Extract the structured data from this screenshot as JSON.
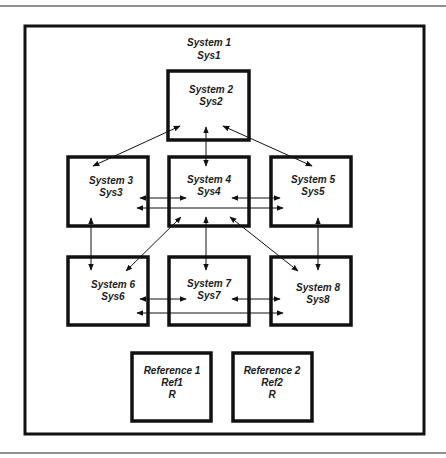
{
  "diagram": {
    "colors": {
      "stroke": "#111111",
      "background": "#ffffff",
      "text": "#1a1a1a"
    },
    "container": {
      "title": "System 1",
      "subtitle": "Sys1"
    },
    "nodes": [
      {
        "id": "sys2",
        "title": "System 2",
        "subtitle": "Sys2"
      },
      {
        "id": "sys3",
        "title": "System 3",
        "subtitle": "Sys3"
      },
      {
        "id": "sys4",
        "title": "System 4",
        "subtitle": "Sys4"
      },
      {
        "id": "sys5",
        "title": "System 5",
        "subtitle": "Sys5"
      },
      {
        "id": "sys6",
        "title": "System 6",
        "subtitle": "Sys6"
      },
      {
        "id": "sys7",
        "title": "System 7",
        "subtitle": "Sys7"
      },
      {
        "id": "sys8",
        "title": "System 8",
        "subtitle": "Sys8"
      }
    ],
    "references": [
      {
        "id": "ref1",
        "title": "Reference 1",
        "subtitle": "Ref1",
        "code": "R"
      },
      {
        "id": "ref2",
        "title": "Reference 2",
        "subtitle": "Ref2",
        "code": "R"
      }
    ],
    "edges": [
      {
        "from": "sys2",
        "to": "sys3",
        "direction": "bidirectional"
      },
      {
        "from": "sys2",
        "to": "sys4",
        "direction": "bidirectional"
      },
      {
        "from": "sys2",
        "to": "sys5",
        "direction": "bidirectional"
      },
      {
        "from": "sys3",
        "to": "sys4",
        "direction": "bidirectional"
      },
      {
        "from": "sys3",
        "to": "sys5",
        "direction": "bidirectional"
      },
      {
        "from": "sys4",
        "to": "sys5",
        "direction": "bidirectional"
      },
      {
        "from": "sys3",
        "to": "sys6",
        "direction": "bidirectional"
      },
      {
        "from": "sys4",
        "to": "sys6",
        "direction": "bidirectional"
      },
      {
        "from": "sys4",
        "to": "sys7",
        "direction": "bidirectional"
      },
      {
        "from": "sys4",
        "to": "sys8",
        "direction": "bidirectional"
      },
      {
        "from": "sys5",
        "to": "sys8",
        "direction": "bidirectional"
      },
      {
        "from": "sys6",
        "to": "sys7",
        "direction": "bidirectional"
      },
      {
        "from": "sys6",
        "to": "sys8",
        "direction": "bidirectional"
      },
      {
        "from": "sys7",
        "to": "sys8",
        "direction": "bidirectional"
      }
    ]
  }
}
